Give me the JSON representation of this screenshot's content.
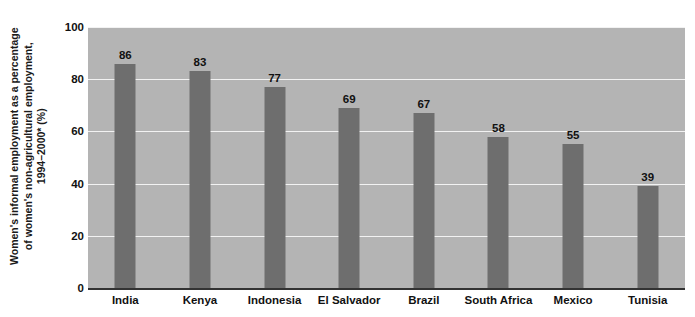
{
  "chart_data": {
    "type": "bar",
    "title": "",
    "xlabel": "",
    "ylabel": "Women's informal employment as a percentage of women's non-agricultural employment, 1994–2000* (%)",
    "ylabel_lines": [
      "Women's informal employment as a percentage",
      "of women's non-agricultural employment,",
      "1994–2000* (%)"
    ],
    "categories": [
      "India",
      "Kenya",
      "Indonesia",
      "El Salvador",
      "Brazil",
      "South Africa",
      "Mexico",
      "Tunisia"
    ],
    "values": [
      86,
      83,
      77,
      69,
      67,
      58,
      55,
      39
    ],
    "value_labels": [
      "86",
      "83",
      "77",
      "69",
      "67",
      "58",
      "55",
      "39"
    ],
    "ylim": [
      0,
      100
    ],
    "yticks": [
      0,
      20,
      40,
      60,
      80,
      100
    ],
    "ytick_labels": [
      "0",
      "20",
      "40",
      "60",
      "80",
      "100"
    ],
    "grid": true,
    "grid_axis": "y",
    "legend": "none",
    "colors": {
      "bar_fill": "#6e6e6e",
      "plot_background": "#b4b4b4",
      "gridline": "#f2f2f2",
      "axis_line": "#333333",
      "text": "#111111",
      "figure_background": "#ffffff"
    }
  }
}
